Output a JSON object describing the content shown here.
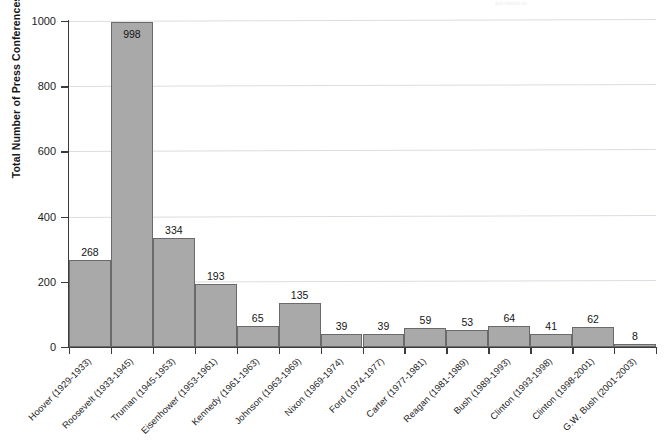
{
  "chart_data": {
    "type": "bar",
    "title": "",
    "xlabel": "",
    "ylabel": "Total Number of Press Conferences",
    "ylim": [
      0,
      1000
    ],
    "yticks": [
      0,
      200,
      400,
      600,
      800,
      1000
    ],
    "ytick_labels": [
      "0",
      "200",
      "400",
      "600",
      "800",
      "1000"
    ],
    "grid": true,
    "legend": null,
    "bar_color": "#a9a9a9",
    "bar_edge_color": "#6a6a6a",
    "categories": [
      "Hoover (1929-1933)",
      "Roosevelt (1933-1945)",
      "Truman (1945-1953)",
      "Eisenhower (1953-1961)",
      "Kennedy (1961-1963)",
      "Johnson (1963-1969)",
      "Nixon (1969-1974)",
      "Ford (1974-1977)",
      "Carter (1977-1981)",
      "Reagan (1981-1989)",
      "Bush (1989-1993)",
      "Clinton (1993-1998)",
      "Clinton (1998-2001)",
      "G.W. Bush (2001-2003)"
    ],
    "values": [
      268,
      998,
      334,
      193,
      65,
      135,
      39,
      39,
      59,
      53,
      64,
      41,
      62,
      8
    ],
    "value_labels": [
      "268",
      "998",
      "334",
      "193",
      "65",
      "135",
      "39",
      "39",
      "59",
      "53",
      "64",
      "41",
      "62",
      "8"
    ]
  },
  "annotations": {
    "bleed_through": "ÿ￼ ￼￼￼ ￼"
  }
}
